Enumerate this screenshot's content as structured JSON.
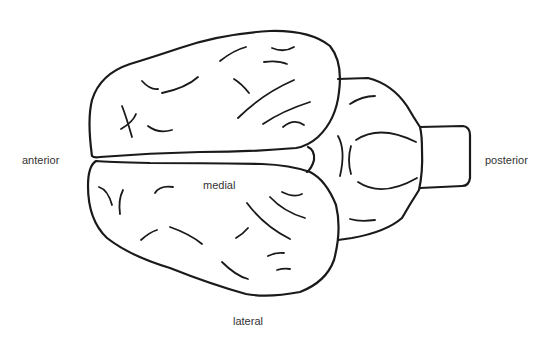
{
  "diagram": {
    "labels": {
      "anterior": "anterior",
      "posterior": "posterior",
      "medial": "medial",
      "lateral": "lateral"
    },
    "colors": {
      "stroke": "#1a1a1a",
      "text": "#333333",
      "background": "#ffffff"
    },
    "parts": [
      "left-cerebral-hemisphere",
      "right-cerebral-hemisphere",
      "cerebellum",
      "brainstem"
    ]
  }
}
